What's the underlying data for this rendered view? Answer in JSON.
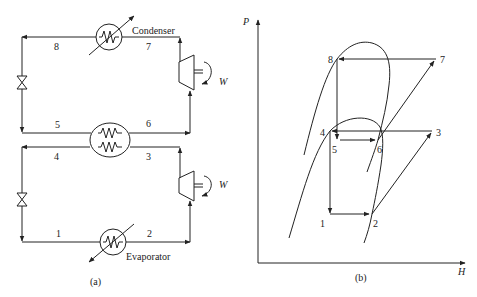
{
  "panel_a": {
    "caption": "(a)",
    "condenser_label": "Condenser",
    "evaporator_label": "Evaporator",
    "work_label_upper": "W",
    "work_label_lower": "W",
    "state_labels": {
      "s8": "8",
      "s7": "7",
      "s5": "5",
      "s6": "6",
      "s4": "4",
      "s3": "3",
      "s1": "1",
      "s2": "2"
    },
    "components": [
      "condenser-heat-exchanger",
      "upper-compressor",
      "upper-expansion-valve",
      "cascade-heat-exchanger",
      "lower-compressor",
      "lower-expansion-valve",
      "evaporator-heat-exchanger"
    ]
  },
  "panel_b": {
    "caption": "(b)",
    "y_axis_label": "P",
    "x_axis_label": "H",
    "state_labels": {
      "s8": "8",
      "s7": "7",
      "s4": "4",
      "s3": "3",
      "s5": "5",
      "s6": "6",
      "s1": "1",
      "s2": "2"
    }
  }
}
